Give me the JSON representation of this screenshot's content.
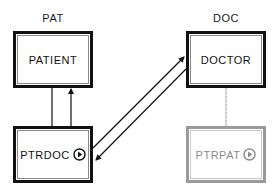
{
  "groups": {
    "pat": {
      "label": "PAT"
    },
    "doc": {
      "label": "DOC"
    }
  },
  "nodes": {
    "patient": {
      "label": "PATIENT",
      "style": "solid"
    },
    "doctor": {
      "label": "DOCTOR",
      "style": "solid"
    },
    "ptrdoc": {
      "label": "PTRDOC",
      "style": "solid",
      "icon": "play-circle-icon"
    },
    "ptrpat": {
      "label": "PTRPAT",
      "style": "ghost",
      "icon": "play-circle-icon"
    }
  },
  "edges": [
    {
      "from": "patient",
      "to": "ptrdoc",
      "type": "line",
      "color": "#111111"
    },
    {
      "from": "ptrdoc",
      "to": "patient",
      "type": "arrow",
      "color": "#111111"
    },
    {
      "from": "ptrdoc",
      "to": "doctor",
      "type": "arrow",
      "color": "#111111"
    },
    {
      "from": "doctor",
      "to": "ptrdoc",
      "type": "arrow",
      "color": "#111111"
    },
    {
      "from": "doctor",
      "to": "ptrpat",
      "type": "line",
      "color": "#8a8a8a"
    }
  ],
  "colors": {
    "border_solid": "#111111",
    "border_ghost": "#9a9a9a",
    "text": "#111111",
    "text_ghost": "#8a8a8a"
  }
}
